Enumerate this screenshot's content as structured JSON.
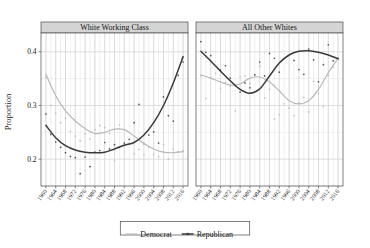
{
  "chart_data": {
    "type": "scatter",
    "title": "",
    "xlabel": "",
    "ylabel": "Proportion",
    "ylim": [
      0.15,
      0.435
    ],
    "xlim": [
      1958,
      2018
    ],
    "grid": true,
    "legend_position": "bottom",
    "yticks": [
      "0.2",
      "0.3",
      "0.4"
    ],
    "ytick_values": [
      0.2,
      0.3,
      0.4
    ],
    "xticks": [
      "1960",
      "1964",
      "1968",
      "1972",
      "1976",
      "1980",
      "1984",
      "1988",
      "1992",
      "1996",
      "2000",
      "2004",
      "2008",
      "2012",
      "2016"
    ],
    "xtick_values": [
      1960,
      1964,
      1968,
      1972,
      1976,
      1980,
      1984,
      1988,
      1992,
      1996,
      2000,
      2004,
      2008,
      2012,
      2016
    ],
    "panels": [
      {
        "label": "White Working Class",
        "series": [
          {
            "name": "Democrat",
            "color": "#b9b9b9",
            "fit_x": [
              1960,
              1964,
              1968,
              1972,
              1976,
              1980,
              1984,
              1988,
              1992,
              1996,
              2000,
              2004,
              2008,
              2012,
              2016
            ],
            "fit_y": [
              0.358,
              0.318,
              0.29,
              0.271,
              0.257,
              0.248,
              0.25,
              0.256,
              0.255,
              0.243,
              0.229,
              0.219,
              0.213,
              0.212,
              0.214
            ],
            "points_x": [
              1960,
              1962,
              1964,
              1966,
              1968,
              1970,
              1972,
              1974,
              1976,
              1978,
              1980,
              1982,
              1984,
              1986,
              1988,
              1990,
              1992,
              1994,
              1996,
              1998,
              2000,
              2002,
              2004,
              2006,
              2008,
              2010,
              2012,
              2014,
              2016
            ],
            "points_y": [
              0.352,
              0.3,
              0.286,
              0.268,
              0.276,
              0.252,
              0.243,
              0.234,
              0.247,
              0.238,
              0.255,
              0.263,
              0.259,
              0.248,
              0.197,
              0.264,
              0.228,
              0.23,
              0.21,
              0.218,
              0.208,
              0.222,
              0.209,
              0.205,
              0.227,
              0.2,
              0.219,
              0.214,
              0.216
            ]
          },
          {
            "name": "Republican",
            "color": "#3a3a3a",
            "fit_x": [
              1960,
              1964,
              1968,
              1972,
              1976,
              1980,
              1984,
              1988,
              1992,
              1996,
              2000,
              2004,
              2008,
              2012,
              2016
            ],
            "fit_y": [
              0.263,
              0.24,
              0.225,
              0.217,
              0.213,
              0.212,
              0.213,
              0.219,
              0.226,
              0.231,
              0.245,
              0.268,
              0.3,
              0.342,
              0.391
            ],
            "points_x": [
              1960,
              1962,
              1964,
              1966,
              1968,
              1970,
              1972,
              1974,
              1976,
              1978,
              1980,
              1982,
              1984,
              1986,
              1988,
              1990,
              1992,
              1994,
              1996,
              1998,
              2000,
              2002,
              2004,
              2006,
              2008,
              2010,
              2012,
              2014,
              2016
            ],
            "points_y": [
              0.284,
              0.246,
              0.232,
              0.222,
              0.212,
              0.205,
              0.203,
              0.173,
              0.204,
              0.186,
              0.213,
              0.216,
              0.231,
              0.219,
              0.227,
              0.222,
              0.23,
              0.237,
              0.268,
              0.302,
              0.229,
              0.245,
              0.251,
              0.23,
              0.316,
              0.281,
              0.271,
              0.356,
              0.381
            ]
          }
        ]
      },
      {
        "label": "All Other Whites",
        "series": [
          {
            "name": "Democrat",
            "color": "#b9b9b9",
            "fit_x": [
              1960,
              1964,
              1968,
              1972,
              1976,
              1980,
              1984,
              1988,
              1992,
              1996,
              2000,
              2004,
              2008,
              2012,
              2016
            ],
            "fit_y": [
              0.357,
              0.351,
              0.344,
              0.338,
              0.34,
              0.351,
              0.353,
              0.344,
              0.327,
              0.309,
              0.303,
              0.309,
              0.33,
              0.361,
              0.388
            ],
            "points_x": [
              1960,
              1962,
              1964,
              1966,
              1968,
              1970,
              1972,
              1974,
              1976,
              1978,
              1980,
              1982,
              1984,
              1986,
              1988,
              1990,
              1992,
              1994,
              1996,
              1998,
              2000,
              2002,
              2004,
              2006,
              2008,
              2010,
              2012,
              2014,
              2016
            ],
            "points_y": [
              0.355,
              0.313,
              0.352,
              0.36,
              0.332,
              0.343,
              0.336,
              0.29,
              0.353,
              0.355,
              0.341,
              0.357,
              0.373,
              0.314,
              0.33,
              0.275,
              0.283,
              0.303,
              0.295,
              0.281,
              0.305,
              0.315,
              0.288,
              0.345,
              0.322,
              0.298,
              0.356,
              0.371,
              0.386
            ]
          },
          {
            "name": "Republican",
            "color": "#3a3a3a",
            "fit_x": [
              1960,
              1964,
              1968,
              1972,
              1976,
              1980,
              1984,
              1988,
              1992,
              1996,
              2000,
              2004,
              2008,
              2012,
              2016
            ],
            "fit_y": [
              0.401,
              0.383,
              0.364,
              0.346,
              0.33,
              0.323,
              0.331,
              0.355,
              0.379,
              0.394,
              0.401,
              0.402,
              0.399,
              0.394,
              0.387
            ],
            "points_x": [
              1960,
              1962,
              1964,
              1966,
              1968,
              1970,
              1972,
              1974,
              1976,
              1978,
              1980,
              1982,
              1984,
              1986,
              1988,
              1990,
              1992,
              1994,
              1996,
              1998,
              2000,
              2002,
              2004,
              2006,
              2008,
              2010,
              2012,
              2014,
              2016
            ],
            "points_y": [
              0.419,
              0.399,
              0.393,
              0.445,
              0.366,
              0.374,
              0.351,
              0.337,
              0.325,
              0.342,
              0.333,
              0.357,
              0.381,
              0.355,
              0.397,
              0.388,
              0.362,
              0.473,
              0.473,
              0.384,
              0.367,
              0.358,
              0.405,
              0.385,
              0.344,
              0.376,
              0.413,
              0.383,
              0.388
            ]
          }
        ]
      }
    ],
    "legend": [
      {
        "label": "Democrat",
        "color": "#b9b9b9",
        "marker": false
      },
      {
        "label": "Republican",
        "color": "#3a3a3a",
        "marker": true
      }
    ]
  },
  "colors": {
    "democrat": "#b9b9b9",
    "republican": "#3a3a3a",
    "strip_bg": "#d4d4d4",
    "grid_major": "#c9c9c9",
    "grid_minor": "#e0e0e0",
    "panel_border": "#4a4a4a",
    "background": "#ffffff"
  }
}
